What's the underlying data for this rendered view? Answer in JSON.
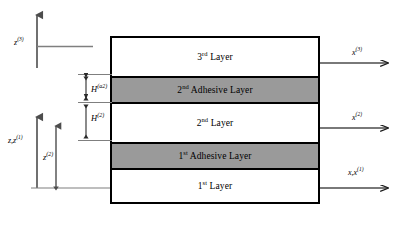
{
  "layers": [
    {
      "id": "layer-3",
      "label_main": "3",
      "label_ord": "rd",
      "label_tail": " Layer",
      "type": "plain"
    },
    {
      "id": "adhesive-2",
      "label_main": "2",
      "label_ord": "nd",
      "label_tail": " Adhesive Layer",
      "type": "adhesive"
    },
    {
      "id": "layer-2",
      "label_main": "2",
      "label_ord": "nd",
      "label_tail": " Layer",
      "type": "plain"
    },
    {
      "id": "adhesive-1",
      "label_main": "1",
      "label_ord": "st",
      "label_tail": " Adhesive Layer",
      "type": "adhesive"
    },
    {
      "id": "layer-1",
      "label_main": "1",
      "label_ord": "st",
      "label_tail": " Layer",
      "type": "plain"
    }
  ],
  "axes": {
    "z_top": {
      "symbol": "z",
      "superscript": "(3)"
    },
    "z_bottom": {
      "symbol": "z,z",
      "superscript": "(1)"
    },
    "x_top": {
      "symbol": "x",
      "superscript": "(3)"
    },
    "x_middle": {
      "symbol": "x",
      "superscript": "(2)"
    },
    "x_bottom": {
      "symbol": "x,x",
      "superscript": "(1)"
    }
  },
  "dimensions": {
    "z2": {
      "symbol": "z",
      "superscript": "(2)"
    },
    "h_adhesive_2": {
      "symbol": "H",
      "superscript": "(a2)"
    },
    "h_layer_2": {
      "symbol": "H",
      "superscript": "(2)"
    }
  },
  "colors": {
    "adhesive_fill": "#9a9a9a",
    "outline": "#000000",
    "leader_line": "#7f7f7f",
    "background": "#ffffff"
  }
}
